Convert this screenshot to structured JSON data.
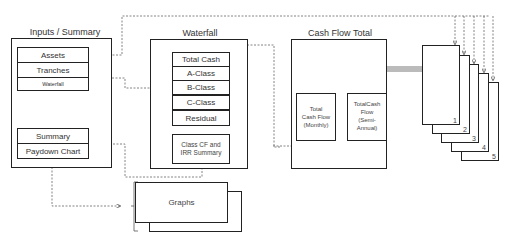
{
  "inputs_summary": {
    "title": "Inputs / Summary",
    "items_top": [
      "Assets",
      "Tranches",
      "Waterfall"
    ],
    "items_bottom": [
      "Summary",
      "Paydown Chart"
    ]
  },
  "waterfall": {
    "title": "Waterfall",
    "items": [
      "Total Cash",
      "A-Class",
      "B-Class",
      "C-Class",
      "Residual"
    ],
    "summary_line1": "Class CF and",
    "summary_line2": "IRR Summary"
  },
  "cash_flow_total": {
    "title": "Cash Flow Total",
    "monthly": [
      "Total",
      "Cash Flow",
      "(Monthly)"
    ],
    "semi_annual": [
      "TotalCash",
      "Flow",
      "(Semi-",
      "Annual)"
    ]
  },
  "pages": [
    "1",
    "2",
    "3",
    "4",
    "5"
  ],
  "graphs": {
    "label": "Graphs"
  },
  "colors": {
    "line": "#222222",
    "dashed": "#666666",
    "arrow_fill": "#bbbbbb"
  }
}
